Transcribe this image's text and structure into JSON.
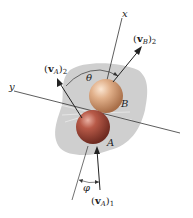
{
  "diagram": {
    "axes": {
      "x_label": "x",
      "y_label": "y"
    },
    "bodies": [
      {
        "name": "A",
        "label": "A",
        "color": "#a54a3c"
      },
      {
        "name": "B",
        "label": "B",
        "color": "#d9a77f"
      }
    ],
    "vectors": {
      "vA1": {
        "base": "v",
        "sub_inner": "A",
        "sub_outer": "1"
      },
      "vA2": {
        "base": "v",
        "sub_inner": "A",
        "sub_outer": "2"
      },
      "vB2": {
        "base": "v",
        "sub_inner": "B",
        "sub_outer": "2"
      }
    },
    "angles": {
      "theta": "θ",
      "phi": "φ"
    },
    "colors": {
      "background_blob": "#cfcfcf",
      "lines": "#333333",
      "sphere_A": "#a54a3c",
      "sphere_B": "#d9a77f"
    }
  }
}
